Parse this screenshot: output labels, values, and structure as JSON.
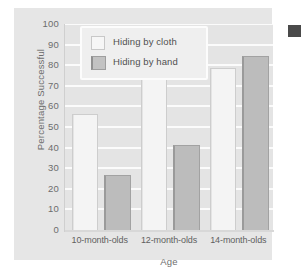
{
  "chart_data": {
    "type": "bar",
    "title": "",
    "xlabel": "Age",
    "ylabel": "Percentage Successful",
    "categories": [
      "10-month-olds",
      "12-month-olds",
      "14-month-olds"
    ],
    "series": [
      {
        "name": "Hiding by cloth",
        "values": [
          56,
          73,
          78
        ],
        "color": "#f4f4f4"
      },
      {
        "name": "Hiding by hand",
        "values": [
          26,
          41,
          84
        ],
        "color": "#bcbcbc"
      }
    ],
    "ylim": [
      0,
      100
    ],
    "yticks": [
      0,
      10,
      20,
      30,
      40,
      50,
      60,
      70,
      80,
      90,
      100
    ],
    "ytick_labels": [
      "0",
      "10",
      "20",
      "30",
      "40",
      "50",
      "60",
      "70",
      "80",
      "90",
      "100"
    ],
    "grid": true,
    "legend_position": "top-left"
  },
  "legend": {
    "items": [
      {
        "label": "Hiding by cloth",
        "swatch": "cloth"
      },
      {
        "label": "Hiding by hand",
        "swatch": "hand"
      }
    ]
  }
}
